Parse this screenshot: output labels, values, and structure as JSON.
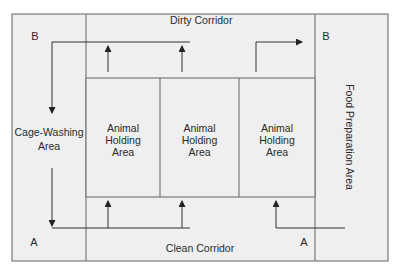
{
  "diagram": {
    "colors": {
      "background": "#ffffff",
      "floor_fill": "#efefef",
      "wall_stroke": "#7a7a7a",
      "arrow_stroke": "#333333",
      "text": "#2a2a2a"
    },
    "areas": {
      "dirty_corridor": "Dirty Corridor",
      "clean_corridor": "Clean Corridor",
      "cage_washing": [
        "Cage-Washing",
        "Area"
      ],
      "food_preparation": "Food Preparation Area",
      "holding_areas": [
        {
          "lines": [
            "Animal",
            "Holding",
            "Area"
          ]
        },
        {
          "lines": [
            "Animal",
            "Holding",
            "Area"
          ]
        },
        {
          "lines": [
            "Animal",
            "Holding",
            "Area"
          ]
        }
      ]
    },
    "markers": {
      "top_left": "B",
      "top_right": "B",
      "bottom_left": "A",
      "bottom_right": "A"
    },
    "flows": [
      {
        "name": "dirty-return-flow",
        "description": "From holding areas up into dirty corridor, left to cage-washing, down to A"
      },
      {
        "name": "dirty-exit-flow",
        "description": "From third holding area up and right toward B"
      },
      {
        "name": "clean-supply-flow",
        "description": "From A along clean corridor up into holding areas"
      },
      {
        "name": "food-supply-flow",
        "description": "From food preparation along clean corridor up into third holding area"
      }
    ]
  }
}
